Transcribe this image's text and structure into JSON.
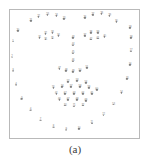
{
  "figure": {
    "caption": "(a)",
    "type": "annotated-landmark-scatter",
    "frame_border_color": "#b9b9b9",
    "background_color": "#ffffff",
    "point_color": "#8c8c8c",
    "label_color": "#6a6a6a"
  },
  "chart_data": {
    "type": "scatter",
    "title": "",
    "subtitle": "",
    "xlabel": "",
    "ylabel": "",
    "xlim": [
      0,
      131
    ],
    "ylim": [
      0,
      130
    ],
    "grid": false,
    "legend": "none",
    "annotations": [
      "(a)"
    ],
    "groups": [
      "left-eyebrow",
      "right-eyebrow",
      "left-eye",
      "right-eye",
      "nose-bridge",
      "nostrils",
      "mouth",
      "face-contour"
    ],
    "points": [
      {
        "id": 21,
        "label": "21",
        "x": 21,
        "y": 11,
        "group": "left-eyebrow"
      },
      {
        "id": 22,
        "label": "22",
        "x": 29,
        "y": 7,
        "group": "left-eyebrow"
      },
      {
        "id": 23,
        "label": "23",
        "x": 38,
        "y": 5,
        "group": "left-eyebrow"
      },
      {
        "id": 24,
        "label": "24",
        "x": 47,
        "y": 6,
        "group": "left-eyebrow"
      },
      {
        "id": 25,
        "label": "25",
        "x": 55,
        "y": 9,
        "group": "left-eyebrow"
      },
      {
        "id": 26,
        "label": "26",
        "x": 76,
        "y": 8,
        "group": "right-eyebrow"
      },
      {
        "id": 27,
        "label": "27",
        "x": 84,
        "y": 5,
        "group": "right-eyebrow"
      },
      {
        "id": 28,
        "label": "28",
        "x": 93,
        "y": 4,
        "group": "right-eyebrow"
      },
      {
        "id": 29,
        "label": "29",
        "x": 101,
        "y": 6,
        "group": "right-eyebrow"
      },
      {
        "id": 30,
        "label": "30",
        "x": 108,
        "y": 12,
        "group": "right-eyebrow"
      },
      {
        "id": 31,
        "label": "31",
        "x": 30,
        "y": 28,
        "group": "left-eye"
      },
      {
        "id": 32,
        "label": "32",
        "x": 36,
        "y": 24,
        "group": "left-eye"
      },
      {
        "id": 33,
        "label": "33",
        "x": 43,
        "y": 23,
        "group": "left-eye"
      },
      {
        "id": 34,
        "label": "34",
        "x": 49,
        "y": 26,
        "group": "left-eye"
      },
      {
        "id": 35,
        "label": "35",
        "x": 43,
        "y": 29,
        "group": "left-eye"
      },
      {
        "id": 36,
        "label": "36",
        "x": 36,
        "y": 30,
        "group": "left-eye"
      },
      {
        "id": 37,
        "label": "37",
        "x": 76,
        "y": 26,
        "group": "right-eye"
      },
      {
        "id": 38,
        "label": "38",
        "x": 82,
        "y": 23,
        "group": "right-eye"
      },
      {
        "id": 39,
        "label": "39",
        "x": 89,
        "y": 23,
        "group": "right-eye"
      },
      {
        "id": 40,
        "label": "40",
        "x": 96,
        "y": 27,
        "group": "right-eye"
      },
      {
        "id": 41,
        "label": "41",
        "x": 89,
        "y": 29,
        "group": "right-eye"
      },
      {
        "id": 42,
        "label": "42",
        "x": 82,
        "y": 30,
        "group": "right-eye"
      },
      {
        "id": 43,
        "label": "43",
        "x": 64,
        "y": 28,
        "group": "nose-bridge"
      },
      {
        "id": 44,
        "label": "44",
        "x": 64,
        "y": 36,
        "group": "nose-bridge"
      },
      {
        "id": 45,
        "label": "45",
        "x": 64,
        "y": 44,
        "group": "nose-bridge"
      },
      {
        "id": 46,
        "label": "46",
        "x": 64,
        "y": 52,
        "group": "nose-bridge"
      },
      {
        "id": 47,
        "label": "47",
        "x": 50,
        "y": 60,
        "group": "nostrils"
      },
      {
        "id": 48,
        "label": "48",
        "x": 57,
        "y": 62,
        "group": "nostrils"
      },
      {
        "id": 49,
        "label": "49",
        "x": 64,
        "y": 63,
        "group": "nostrils"
      },
      {
        "id": 50,
        "label": "50",
        "x": 71,
        "y": 62,
        "group": "nostrils"
      },
      {
        "id": 51,
        "label": "51",
        "x": 78,
        "y": 59,
        "group": "nostrils"
      },
      {
        "id": 52,
        "label": "52",
        "x": 59,
        "y": 73,
        "group": "mouth"
      },
      {
        "id": 53,
        "label": "53",
        "x": 68,
        "y": 72,
        "group": "mouth"
      },
      {
        "id": 54,
        "label": "54",
        "x": 77,
        "y": 74,
        "group": "mouth"
      },
      {
        "id": 55,
        "label": "55",
        "x": 44,
        "y": 79,
        "group": "mouth"
      },
      {
        "id": 56,
        "label": "56",
        "x": 53,
        "y": 78,
        "group": "mouth"
      },
      {
        "id": 57,
        "label": "57",
        "x": 62,
        "y": 78,
        "group": "mouth"
      },
      {
        "id": 58,
        "label": "58",
        "x": 71,
        "y": 78,
        "group": "mouth"
      },
      {
        "id": 59,
        "label": "59",
        "x": 80,
        "y": 79,
        "group": "mouth"
      },
      {
        "id": 60,
        "label": "60",
        "x": 88,
        "y": 81,
        "group": "mouth"
      },
      {
        "id": 61,
        "label": "61",
        "x": 47,
        "y": 85,
        "group": "mouth"
      },
      {
        "id": 62,
        "label": "62",
        "x": 56,
        "y": 85,
        "group": "mouth"
      },
      {
        "id": 63,
        "label": "63",
        "x": 65,
        "y": 85,
        "group": "mouth"
      },
      {
        "id": 64,
        "label": "64",
        "x": 74,
        "y": 85,
        "group": "mouth"
      },
      {
        "id": 65,
        "label": "65",
        "x": 83,
        "y": 85,
        "group": "mouth"
      },
      {
        "id": 66,
        "label": "66",
        "x": 50,
        "y": 91,
        "group": "mouth"
      },
      {
        "id": 67,
        "label": "67",
        "x": 59,
        "y": 91,
        "group": "mouth"
      },
      {
        "id": 68,
        "label": "68",
        "x": 68,
        "y": 91,
        "group": "mouth"
      },
      {
        "id": 69,
        "label": "69",
        "x": 77,
        "y": 92,
        "group": "mouth"
      },
      {
        "id": 70,
        "label": "70",
        "x": 56,
        "y": 97,
        "group": "mouth"
      },
      {
        "id": 71,
        "label": "71",
        "x": 65,
        "y": 98,
        "group": "mouth"
      },
      {
        "id": 72,
        "label": "72",
        "x": 74,
        "y": 97,
        "group": "mouth"
      },
      {
        "id": 1,
        "label": "1",
        "x": 3,
        "y": 32,
        "group": "face-contour"
      },
      {
        "id": 2,
        "label": "2",
        "x": 2,
        "y": 48,
        "group": "face-contour"
      },
      {
        "id": 3,
        "label": "3",
        "x": 3,
        "y": 62,
        "group": "face-contour"
      },
      {
        "id": 4,
        "label": "4",
        "x": 6,
        "y": 76,
        "group": "face-contour"
      },
      {
        "id": 5,
        "label": "5",
        "x": 12,
        "y": 90,
        "group": "face-contour"
      },
      {
        "id": 6,
        "label": "6",
        "x": 21,
        "y": 102,
        "group": "face-contour"
      },
      {
        "id": 7,
        "label": "7",
        "x": 31,
        "y": 112,
        "group": "face-contour"
      },
      {
        "id": 8,
        "label": "8",
        "x": 44,
        "y": 119,
        "group": "face-contour"
      },
      {
        "id": 9,
        "label": "9",
        "x": 57,
        "y": 122,
        "group": "face-contour"
      },
      {
        "id": 10,
        "label": "10",
        "x": 70,
        "y": 121,
        "group": "face-contour"
      },
      {
        "id": 11,
        "label": "11",
        "x": 83,
        "y": 115,
        "group": "face-contour"
      },
      {
        "id": 12,
        "label": "12",
        "x": 95,
        "y": 107,
        "group": "face-contour"
      },
      {
        "id": 13,
        "label": "13",
        "x": 105,
        "y": 96,
        "group": "face-contour"
      },
      {
        "id": 14,
        "label": "14",
        "x": 113,
        "y": 84,
        "group": "face-contour"
      },
      {
        "id": 15,
        "label": "15",
        "x": 119,
        "y": 70,
        "group": "face-contour"
      },
      {
        "id": 16,
        "label": "16",
        "x": 122,
        "y": 56,
        "group": "face-contour"
      },
      {
        "id": 17,
        "label": "17",
        "x": 123,
        "y": 42,
        "group": "face-contour"
      },
      {
        "id": 18,
        "label": "18",
        "x": 123,
        "y": 28,
        "group": "face-contour"
      },
      {
        "id": 19,
        "label": "19",
        "x": 122,
        "y": 18,
        "group": "face-contour"
      },
      {
        "id": 20,
        "label": "20",
        "x": 8,
        "y": 21,
        "group": "face-contour"
      }
    ]
  }
}
